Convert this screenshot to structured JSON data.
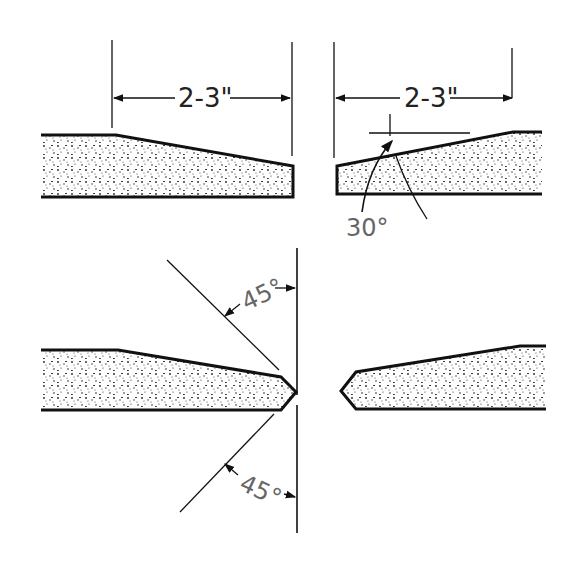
{
  "figure": {
    "top_left_dimension": "2-3\"",
    "top_right_dimension": "2-3\"",
    "bevel_angle": "30°",
    "upper_point_angle": "45°",
    "lower_point_angle": "45°"
  },
  "colors": {
    "line": "#111111",
    "label": "#222222",
    "angle_label": "#666666",
    "fill": "#ffffff",
    "speckle": "#222222"
  }
}
